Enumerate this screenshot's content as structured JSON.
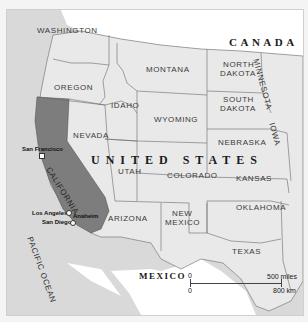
{
  "map": {
    "countries": {
      "canada": "CANADA",
      "usa": "UNITED STATES",
      "mexico": "MEXICO"
    },
    "states": {
      "washington": "WASHINGTON",
      "oregon": "OREGON",
      "idaho": "IDAHO",
      "montana": "MONTANA",
      "north_dakota_1": "NORTH",
      "north_dakota_2": "DAKOTA",
      "south_dakota_1": "SOUTH",
      "south_dakota_2": "DAKOTA",
      "minnesota": "MINNESOTA",
      "wyoming": "WYOMING",
      "nevada": "NEVADA",
      "california": "CALIFORNIA",
      "utah": "UTAH",
      "colorado": "COLORADO",
      "nebraska": "NEBRASKA",
      "iowa": "IOWA",
      "kansas": "KANSAS",
      "arizona": "ARIZONA",
      "new_mexico_1": "NEW",
      "new_mexico_2": "MEXICO",
      "oklahoma": "OKLAHOMA",
      "texas": "TEXAS"
    },
    "cities": [
      "San Francisco",
      "Los Angeles",
      "Anaheim",
      "San Diego"
    ],
    "water": {
      "pacific": "PACIFIC OCEAN"
    },
    "scale": {
      "zero_top": "0",
      "zero_bottom": "0",
      "miles": "500 miles",
      "km": "800 km"
    },
    "colors": {
      "ocean": "#d9d9d9",
      "land_us": "#e9e9e9",
      "foreign": "#ffffff",
      "highlight_california": "#7d7d7d",
      "border": "#6a6a6a"
    }
  }
}
